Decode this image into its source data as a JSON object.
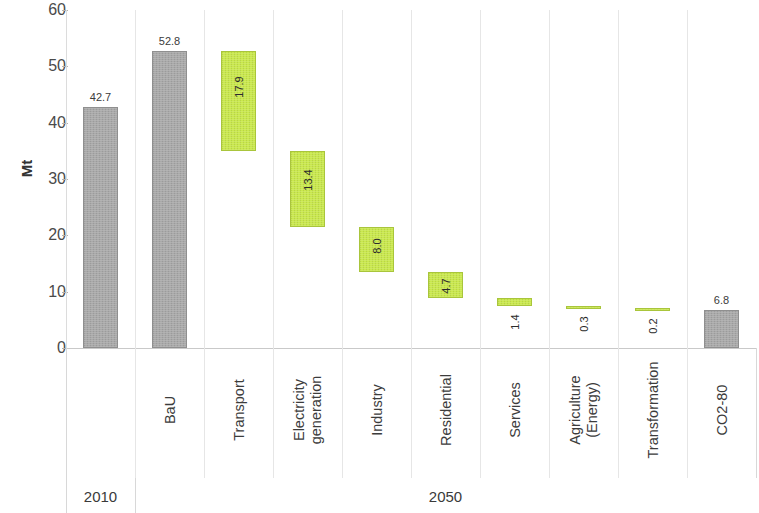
{
  "chart_data": {
    "type": "bar",
    "subtype": "waterfall",
    "title": "",
    "xlabel": "",
    "ylabel": "Mt",
    "ylim": [
      0,
      60
    ],
    "ytick_step": 10,
    "yticks": [
      0,
      10,
      20,
      30,
      40,
      50,
      60
    ],
    "grid": false,
    "legend": "none",
    "categories": [
      "2010",
      "BaU",
      "Transport",
      "Electricity generation",
      "Industry",
      "Residential",
      "Services",
      "Agriculture (Energy)",
      "Transformation",
      "CO2-80"
    ],
    "values": [
      42.7,
      52.8,
      17.9,
      13.4,
      8.0,
      4.7,
      1.4,
      0.3,
      0.2,
      6.8
    ],
    "value_labels": [
      "42.7",
      "52.8",
      "17.9",
      "13.4",
      "8.0",
      "4.7",
      "1.4",
      "0.3",
      "0.2",
      "6.8"
    ],
    "bars": [
      {
        "label": "2010",
        "label_lines": [
          ""
        ],
        "value": 42.7,
        "value_label": "42.7",
        "kind": "total",
        "color": "#a9a9a9",
        "base": 0.0,
        "top": 42.7,
        "label_mode": "above"
      },
      {
        "label": "BaU",
        "label_lines": [
          "BaU"
        ],
        "value": 52.8,
        "value_label": "52.8",
        "kind": "total",
        "color": "#a9a9a9",
        "base": 0.0,
        "top": 52.8,
        "label_mode": "above"
      },
      {
        "label": "Transport",
        "label_lines": [
          "Transport"
        ],
        "value": 17.9,
        "value_label": "17.9",
        "kind": "reduction",
        "color": "#c9e84c",
        "base": 34.9,
        "top": 52.8,
        "label_mode": "inside"
      },
      {
        "label": "Electricity generation",
        "label_lines": [
          "Electricity",
          "generation"
        ],
        "value": 13.4,
        "value_label": "13.4",
        "kind": "reduction",
        "color": "#c9e84c",
        "base": 21.5,
        "top": 34.9,
        "label_mode": "inside"
      },
      {
        "label": "Industry",
        "label_lines": [
          "Industry"
        ],
        "value": 8.0,
        "value_label": "8.0",
        "kind": "reduction",
        "color": "#c9e84c",
        "base": 13.5,
        "top": 21.5,
        "label_mode": "inside"
      },
      {
        "label": "Residential",
        "label_lines": [
          "Residential"
        ],
        "value": 4.7,
        "value_label": "4.7",
        "kind": "reduction",
        "color": "#c9e84c",
        "base": 8.8,
        "top": 13.5,
        "label_mode": "inside"
      },
      {
        "label": "Services",
        "label_lines": [
          "Services"
        ],
        "value": 1.4,
        "value_label": "1.4",
        "kind": "reduction",
        "color": "#c9e84c",
        "base": 7.4,
        "top": 8.8,
        "label_mode": "below"
      },
      {
        "label": "Agriculture (Energy)",
        "label_lines": [
          "Agriculture",
          "(Energy)"
        ],
        "value": 0.3,
        "value_label": "0.3",
        "kind": "reduction",
        "color": "#c9e84c",
        "base": 7.1,
        "top": 7.4,
        "label_mode": "below"
      },
      {
        "label": "Transformation",
        "label_lines": [
          "Transformation"
        ],
        "value": 0.2,
        "value_label": "0.2",
        "kind": "reduction",
        "color": "#c9e84c",
        "base": 6.8,
        "top": 7.1,
        "label_mode": "below"
      },
      {
        "label": "CO2-80",
        "label_lines": [
          "CO2-80"
        ],
        "value": 6.8,
        "value_label": "6.8",
        "kind": "total",
        "color": "#a9a9a9",
        "base": 0.0,
        "top": 6.8,
        "label_mode": "above"
      }
    ],
    "period_groups": [
      {
        "label": "2010",
        "from_index": 0,
        "to_index": 0
      },
      {
        "label": "2050",
        "from_index": 1,
        "to_index": 9
      }
    ],
    "colors": {
      "total_bar": "#a9a9a9",
      "reduction_bar": "#c9e84c",
      "axis": "#c9c9c9",
      "text": "#3a3a3a",
      "background": "#ffffff"
    }
  }
}
